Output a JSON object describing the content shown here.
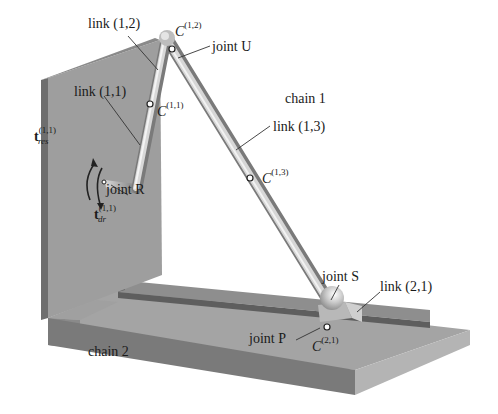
{
  "figure": {
    "colors": {
      "background": "#ffffff",
      "wall_face": "#9e9e9e",
      "wall_edge": "#6e6e6e",
      "base_top": "#a4a4a4",
      "base_front": "#7a7a7a",
      "rail_top": "#8e8e8e",
      "rail_side": "#5e5e5e",
      "link": "#c9c9c9",
      "text": "#1a1a1a",
      "leader_line": "#333333"
    }
  },
  "labels": {
    "link_1_2": "link (1,2)",
    "link_1_1": "link (1,1)",
    "link_1_3": "link (1,3)",
    "link_2_1": "link (2,1)",
    "chain_1": "chain 1",
    "chain_2": "chain 2",
    "joint_U": "joint U",
    "joint_R": "joint R",
    "joint_S": "joint S",
    "joint_P": "joint P",
    "C_1_2": {
      "base": "C",
      "sup": "(1,2)"
    },
    "C_1_1": {
      "base": "C",
      "sup": "(1,1)"
    },
    "C_1_3": {
      "base": "C",
      "sup": "(1,3)"
    },
    "C_2_1": {
      "base": "C",
      "sup": "(2,1)"
    },
    "t_res": {
      "base": "t",
      "sup": "(1,1)",
      "sub": "res"
    },
    "t_dr": {
      "base": "t",
      "sup": "(1,1)",
      "sub": "dr"
    }
  }
}
